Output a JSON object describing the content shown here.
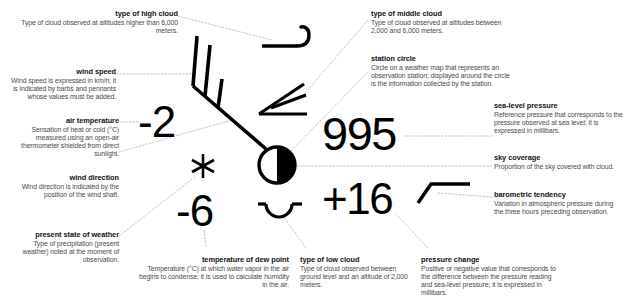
{
  "diagram": {
    "theme": {
      "background": "#ffffff",
      "ink": "#000000",
      "title_color": "#111111",
      "body_color": "#4a4a4a",
      "leader_color": "#9a9a9a"
    }
  },
  "values": {
    "air_temperature": "-2",
    "dew_point": "-6",
    "sea_level_pressure": "995",
    "pressure_change": "+16"
  },
  "symbols": {
    "high_cloud": "high-cloud-hook-symbol",
    "middle_cloud": "middle-cloud-wedge-symbol",
    "low_cloud": "low-cloud-arc-symbol",
    "station_circle": "half-filled-station-circle",
    "wind_barb": "wind-barb-shaft-with-barbs",
    "present_weather": "snowflake-asterisk-symbol",
    "barometric_tendency": "rising-then-steady-line-symbol"
  },
  "callouts": [
    {
      "key": "type_of_high_cloud",
      "title": "type of high cloud",
      "desc": "Type of cloud observed at altitudes higher than 6,000 meters."
    },
    {
      "key": "wind_speed",
      "title": "wind speed",
      "desc": "Wind speed is expressed in km/h; it is indicated by barbs and pennants whose values must be added."
    },
    {
      "key": "air_temperature",
      "title": "air temperature",
      "desc": "Sensation of heat or cold (°C) measured using an open-air thermometer shielded from direct sunlight."
    },
    {
      "key": "wind_direction",
      "title": "wind direction",
      "desc": "Wind direction is indicated by the position of the wind shaft."
    },
    {
      "key": "present_state_of_weather",
      "title": "present state of weather",
      "desc": "Type of precipitation (present weather) noted at the moment of observation."
    },
    {
      "key": "type_of_middle_cloud",
      "title": "type of middle cloud",
      "desc": "Type of cloud observed at altitudes between 2,000 and 6,000 meters."
    },
    {
      "key": "station_circle",
      "title": "station circle",
      "desc": "Circle on a weather map that represents an observation station; displayed around the circle is the information collected by the station."
    },
    {
      "key": "sea_level_pressure",
      "title": "sea-level pressure",
      "desc": "Reference pressure that corresponds to the pressure observed at sea level; it is expressed in millibars."
    },
    {
      "key": "sky_coverage",
      "title": "sky coverage",
      "desc": "Proportion of the sky covered with cloud."
    },
    {
      "key": "barometric_tendency",
      "title": "barometric tendency",
      "desc": "Variation in atmospheric pressure during the three hours preceding observation."
    },
    {
      "key": "temperature_of_dew_point",
      "title": "temperature of dew point",
      "desc": "Temperature (°C) at which water vapor in the air begins to condense; it is used to calculate humidity in the air."
    },
    {
      "key": "type_of_low_cloud",
      "title": "type of low cloud",
      "desc": "Type of cloud observed between ground level and an altitude of 2,000 meters."
    },
    {
      "key": "pressure_change",
      "title": "pressure change",
      "desc": "Positive or negative value that corresponds to the difference between the pressure reading and sea-level pressure; it is expressed in millibars."
    }
  ]
}
